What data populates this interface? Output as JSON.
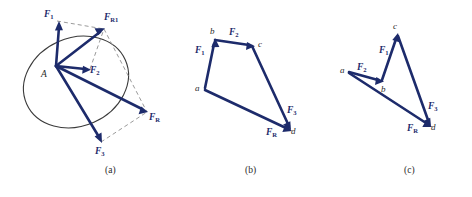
{
  "figure": {
    "panels": [
      {
        "id": "a",
        "caption": "(a)",
        "method": "parallelogram-law",
        "origin_label": "A",
        "vectors": [
          {
            "name": "F1",
            "label_main": "F",
            "label_sub": "1"
          },
          {
            "name": "F2",
            "label_main": "F",
            "label_sub": "2"
          },
          {
            "name": "F3",
            "label_main": "F",
            "label_sub": "3"
          },
          {
            "name": "FR1",
            "label_main": "F",
            "label_sub": "R1"
          },
          {
            "name": "FR",
            "label_main": "F",
            "label_sub": "R"
          }
        ]
      },
      {
        "id": "b",
        "caption": "(b)",
        "method": "force-polygon",
        "points": [
          "a",
          "b",
          "c",
          "d"
        ],
        "vectors": [
          {
            "name": "F1",
            "label_main": "F",
            "label_sub": "1",
            "from": "a",
            "to": "b"
          },
          {
            "name": "F2",
            "label_main": "F",
            "label_sub": "2",
            "from": "b",
            "to": "c"
          },
          {
            "name": "F3",
            "label_main": "F",
            "label_sub": "3",
            "from": "c",
            "to": "d"
          },
          {
            "name": "FR",
            "label_main": "F",
            "label_sub": "R",
            "from": "a",
            "to": "d"
          }
        ]
      },
      {
        "id": "c",
        "caption": "(c)",
        "method": "force-polygon-reordered",
        "points": [
          "a",
          "b",
          "c",
          "d"
        ],
        "vectors": [
          {
            "name": "F2",
            "label_main": "F",
            "label_sub": "2",
            "from": "a",
            "to": "b"
          },
          {
            "name": "F1",
            "label_main": "F",
            "label_sub": "1",
            "from": "b",
            "to": "c"
          },
          {
            "name": "F3",
            "label_main": "F",
            "label_sub": "3",
            "from": "c",
            "to": "d"
          },
          {
            "name": "FR",
            "label_main": "F",
            "label_sub": "R",
            "from": "a",
            "to": "d"
          }
        ]
      }
    ],
    "colors": {
      "vector": "#1d2b6b",
      "construction": "#8e8e8e",
      "outline": "#3a3a3a",
      "point_label": "#2a2a2a",
      "background": "#ffffff"
    }
  }
}
